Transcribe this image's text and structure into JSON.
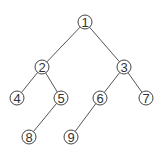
{
  "diagram": {
    "type": "binary-tree",
    "nodes": [
      {
        "id": "1",
        "label": "1",
        "x": 85,
        "y": 22
      },
      {
        "id": "2",
        "label": "2",
        "x": 42,
        "y": 67
      },
      {
        "id": "3",
        "label": "3",
        "x": 124,
        "y": 67
      },
      {
        "id": "4",
        "label": "4",
        "x": 17,
        "y": 98
      },
      {
        "id": "5",
        "label": "5",
        "x": 61,
        "y": 98
      },
      {
        "id": "6",
        "label": "6",
        "x": 100,
        "y": 98
      },
      {
        "id": "7",
        "label": "7",
        "x": 146,
        "y": 98
      },
      {
        "id": "8",
        "label": "8",
        "x": 29,
        "y": 137
      },
      {
        "id": "9",
        "label": "9",
        "x": 71,
        "y": 137
      }
    ],
    "edges": [
      {
        "from": "1",
        "to": "2"
      },
      {
        "from": "1",
        "to": "3"
      },
      {
        "from": "2",
        "to": "4"
      },
      {
        "from": "2",
        "to": "5"
      },
      {
        "from": "3",
        "to": "6"
      },
      {
        "from": "3",
        "to": "7"
      },
      {
        "from": "5",
        "to": "8"
      },
      {
        "from": "6",
        "to": "9"
      }
    ],
    "node_radius": 7
  }
}
